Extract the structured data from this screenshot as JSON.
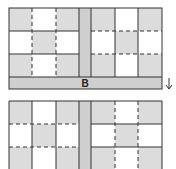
{
  "diagram": {
    "top_block": {
      "label": "B",
      "left_panel": {
        "shading": [
          [
            1,
            0,
            1
          ],
          [
            0,
            1,
            0
          ],
          [
            1,
            0,
            1
          ]
        ],
        "solid_lines": "horizontal",
        "dashed_lines": "vertical"
      },
      "right_panel": {
        "shading": [
          [
            1,
            0,
            1
          ],
          [
            0,
            1,
            0
          ],
          [
            1,
            0,
            1
          ]
        ],
        "solid_lines": "vertical",
        "dashed_lines": "horizontal"
      }
    },
    "arrow": "down-arrow",
    "bottom_block": {
      "left_panel": {
        "shading": [
          [
            1,
            0,
            1
          ],
          [
            0,
            1,
            0
          ],
          [
            1,
            0,
            1
          ]
        ],
        "solid_lines": "vertical",
        "dashed_lines": "horizontal"
      },
      "right_panel": {
        "shading": [
          [
            1,
            0,
            1
          ],
          [
            0,
            1,
            0
          ],
          [
            1,
            0,
            1
          ]
        ],
        "solid_lines": "horizontal",
        "dashed_lines": "vertical"
      }
    },
    "colors": {
      "shade": "#dcdcdc",
      "strip": "#cfcfcf",
      "line": "#333333",
      "white": "#ffffff"
    }
  }
}
